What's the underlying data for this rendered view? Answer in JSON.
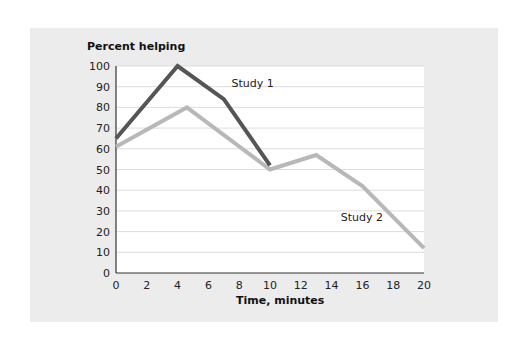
{
  "chart_data": {
    "type": "line",
    "title": "",
    "ylabel": "Percent helping",
    "xlabel": "Time, minutes",
    "xlim": [
      0,
      20
    ],
    "ylim": [
      0,
      100
    ],
    "xticks": [
      0,
      2,
      4,
      6,
      8,
      10,
      12,
      14,
      16,
      18,
      20
    ],
    "yticks": [
      0,
      10,
      20,
      30,
      40,
      50,
      60,
      70,
      80,
      90,
      100
    ],
    "grid": true,
    "legend": "inline labels",
    "series": [
      {
        "name": "Study 1",
        "color": "#555555",
        "points": [
          [
            0,
            65
          ],
          [
            4,
            100
          ],
          [
            7,
            84
          ],
          [
            10,
            52
          ]
        ],
        "label_pos": [
          7.5,
          90
        ]
      },
      {
        "name": "Study 2",
        "color": "#b8b8b8",
        "points": [
          [
            0,
            61
          ],
          [
            4.6,
            80
          ],
          [
            10,
            50
          ],
          [
            13,
            57
          ],
          [
            16,
            42
          ],
          [
            20,
            12
          ]
        ],
        "label_pos": [
          14.6,
          25
        ]
      }
    ]
  },
  "colors": {
    "panel_bg": "#ececec",
    "plot_bg": "#ffffff",
    "gridline": "#dddddd",
    "axis": "#333333"
  }
}
